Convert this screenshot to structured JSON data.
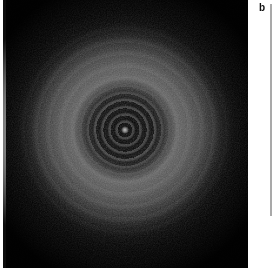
{
  "figure": {
    "panel_letter": "b",
    "caption_text": "",
    "background_color": "#ffffff"
  },
  "image_panel": {
    "name": "diffraction-pattern",
    "description": "Dark-field concentric interference ring pattern on black background",
    "background_color": "#000000",
    "halo_color": "#636363",
    "fringe_color": "#969696",
    "center_spot_color": "#bebebe",
    "center_x": 122,
    "center_y": 130,
    "core_radius": 50,
    "halo_radius": 122,
    "visible_fringe_count": 7
  },
  "right_rule": {
    "name": "vertical-divider",
    "color": "#a9a9a9"
  },
  "left_rule": {
    "name": "panel-left-margin-rule",
    "color": "#f2f2f2"
  }
}
